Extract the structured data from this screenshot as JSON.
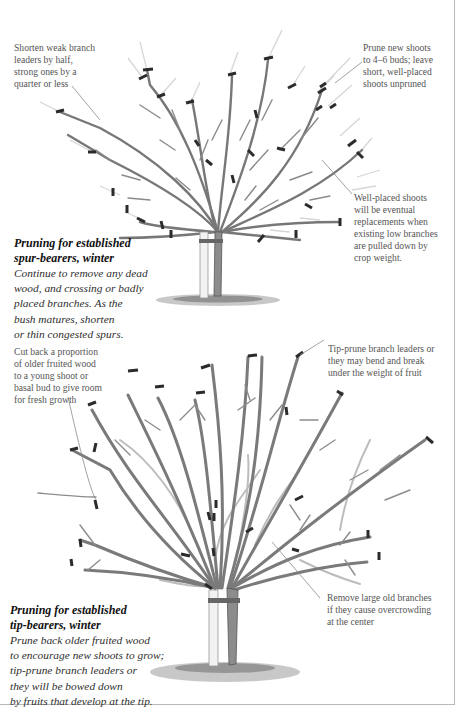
{
  "figure": {
    "top_tree": {
      "annotations": {
        "top_left": "Shorten weak branch\nleaders by half,\nstrong ones by a\nquarter or less",
        "top_right": "Prune new shoots\nto 4–6 buds; leave\nshort, well-placed\nshoots unpruned",
        "middle_right": "Well-placed shoots\nwill be eventual\nreplacements when\nexisting low branches\nare pulled down by\ncrop weight."
      },
      "caption": {
        "title": "Pruning for established\nspur-bearers, winter",
        "body": "Continue to remove any dead\nwood, and crossing or badly\nplaced branches. As the\nbush matures, shorten\nor thin congested spurs."
      }
    },
    "bottom_tree": {
      "annotations": {
        "top_left": "Cut back a proportion\nof older fruited wood\nto a young shoot or\nbasal bud to give room\nfor fresh growth",
        "top_right": "Tip-prune branch leaders or\nthey may bend and break\nunder the weight of fruit",
        "bottom_right": "Remove large old branches\nif they cause overcrowding\nat the center"
      },
      "caption": {
        "title": "Pruning for established\ntip-bearers, winter",
        "body": "Prune back older fruited wood\nto encourage new shoots to grow;\ntip-prune branch leaders or\nthey will be bowed down\nby fruits that develop at the tip."
      }
    },
    "colors": {
      "branch": "#6f6f6f",
      "branch_light": "#b9b9b9",
      "cut_mark": "#2b2b2b",
      "new_shoot": "#d4d4d4",
      "ground": "#8a8a8a",
      "stake": "#f2f2f2"
    }
  }
}
